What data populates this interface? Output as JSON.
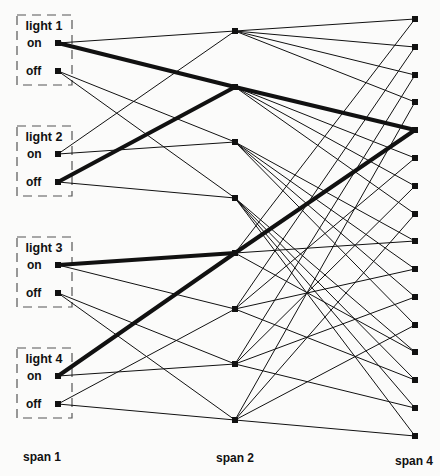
{
  "colors": {
    "ink": "#111111",
    "background": "#fbfbfa",
    "dash": "#555555"
  },
  "column_labels": [
    {
      "text": "span 1",
      "x": 42,
      "y": 457
    },
    {
      "text": "span 2",
      "x": 235,
      "y": 458
    },
    {
      "text": "span 4",
      "x": 414,
      "y": 461
    }
  ],
  "lights": [
    {
      "title": "light 1",
      "on_label": "on",
      "off_label": "off",
      "box_top": 15
    },
    {
      "title": "light 2",
      "on_label": "on",
      "off_label": "off",
      "box_top": 126
    },
    {
      "title": "light 3",
      "on_label": "on",
      "off_label": "off",
      "box_top": 237
    },
    {
      "title": "light 4",
      "on_label": "on",
      "off_label": "off",
      "box_top": 348
    }
  ],
  "nodes": {
    "span1": {
      "x": 58,
      "y": [
        43,
        71,
        154,
        182,
        265,
        293,
        376,
        404
      ]
    },
    "span2": {
      "x": 235,
      "y": [
        31,
        87,
        142,
        198,
        253,
        309,
        364,
        420
      ]
    },
    "span4": {
      "x": 415,
      "y": [
        19,
        47,
        75,
        102,
        130,
        158,
        186,
        214,
        241,
        269,
        297,
        325,
        352,
        380,
        408,
        436
      ]
    }
  },
  "edges_span1_span2": [
    {
      "from": 0,
      "to": 0,
      "bold": false
    },
    {
      "from": 0,
      "to": 1,
      "bold": true
    },
    {
      "from": 1,
      "to": 2,
      "bold": false
    },
    {
      "from": 1,
      "to": 3,
      "bold": false
    },
    {
      "from": 2,
      "to": 0,
      "bold": false
    },
    {
      "from": 2,
      "to": 2,
      "bold": false
    },
    {
      "from": 3,
      "to": 1,
      "bold": true
    },
    {
      "from": 3,
      "to": 3,
      "bold": false
    },
    {
      "from": 4,
      "to": 4,
      "bold": true
    },
    {
      "from": 4,
      "to": 5,
      "bold": false
    },
    {
      "from": 5,
      "to": 6,
      "bold": false
    },
    {
      "from": 5,
      "to": 7,
      "bold": false
    },
    {
      "from": 6,
      "to": 4,
      "bold": true
    },
    {
      "from": 6,
      "to": 6,
      "bold": false
    },
    {
      "from": 7,
      "to": 5,
      "bold": false
    },
    {
      "from": 7,
      "to": 7,
      "bold": false
    }
  ],
  "edges_span2_span4_rule": "span2 node k (0-3) connects to span4 nodes 4k..4k+3; span2 node 4+j connects to span4 nodes j, j+4, j+8, j+12",
  "bold_path_target": 4
}
